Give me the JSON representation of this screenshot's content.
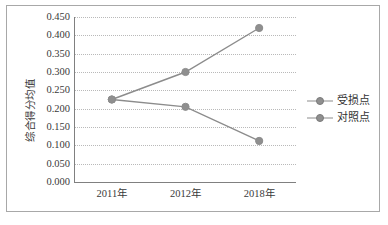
{
  "chart_data": {
    "type": "line",
    "title": "",
    "xlabel": "",
    "ylabel": "综合得分均值",
    "categories": [
      "2011年",
      "2012年",
      "2018年"
    ],
    "series": [
      {
        "name": "受损点",
        "values": [
          0.225,
          0.3,
          0.42
        ],
        "color": "#8c8c8c"
      },
      {
        "name": "对照点",
        "values": [
          0.225,
          0.205,
          0.112
        ],
        "color": "#8c8c8c"
      }
    ],
    "ylim": [
      0.0,
      0.45
    ],
    "ystep": 0.05,
    "ytick_labels": [
      "0.000",
      "0.050",
      "0.100",
      "0.150",
      "0.200",
      "0.250",
      "0.300",
      "0.350",
      "0.400",
      "0.450"
    ],
    "grid": "horizontal-dotted",
    "legend_position": "right"
  },
  "legend": {
    "items": [
      {
        "label": "受损点"
      },
      {
        "label": "对照点"
      }
    ]
  },
  "colors": {
    "line": "#8c8c8c",
    "marker": "#8f8f8f",
    "grid": "#b9b9b9",
    "axis": "#808080",
    "border": "#a8a8a8",
    "text": "#3a3a3a"
  }
}
